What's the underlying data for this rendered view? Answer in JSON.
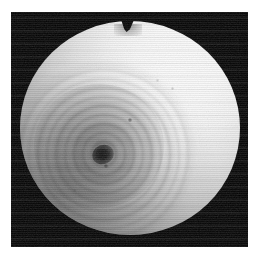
{
  "image": {
    "kind": "grayscale-photomicrograph",
    "subject_label": "spherical specimen with concentric spiral rings",
    "canvas_width": 258,
    "canvas_height": 258,
    "page_background": "#ffffff",
    "frame": {
      "label": "black image frame",
      "x": 11,
      "y": 12,
      "width": 237,
      "height": 235,
      "background_color": "#000000"
    },
    "specimen": {
      "label": "illuminated spherical body",
      "center_x": 130,
      "center_y": 128,
      "radius_x": 110,
      "radius_y": 107,
      "highlight_color": "#fdfdfd",
      "midtone_color": "#c9c9c9",
      "shadow_color": "#6a6a6a",
      "highlight_position": "upper-right",
      "shadow_position": "lower-left"
    },
    "notch": {
      "label": "V-shaped cleft at top apex",
      "center_x": 127,
      "top_y": 12,
      "depth": 18,
      "width": 24,
      "color": "#000000"
    },
    "spiral": {
      "label": "concentric ring / spiral structure",
      "center_x": 93,
      "center_y": 143,
      "outer_radius": 90,
      "ring_count": 14,
      "ring_spacing_px": 9,
      "ring_tone": "#141414",
      "core": {
        "label": "dark nucleus",
        "center_x": 92,
        "center_y": 144,
        "width": 22,
        "height": 19,
        "color": "#111111"
      }
    },
    "specks": [
      {
        "name": "speck-upper-right-1",
        "x": 157,
        "y": 80,
        "size": 3,
        "opacity": 0.16
      },
      {
        "name": "speck-upper-right-2",
        "x": 172,
        "y": 88,
        "size": 3,
        "opacity": 0.2
      },
      {
        "name": "speck-center-right",
        "x": 130,
        "y": 120,
        "size": 4,
        "opacity": 0.45
      },
      {
        "name": "speck-lower-center",
        "x": 106,
        "y": 166,
        "size": 4,
        "opacity": 0.42
      },
      {
        "name": "speck-upper-left",
        "x": 64,
        "y": 101,
        "size": 3,
        "opacity": 0.18
      },
      {
        "name": "speck-lower-left",
        "x": 74,
        "y": 190,
        "size": 3,
        "opacity": 0.15
      }
    ],
    "texture": {
      "label": "horizontal scanline interlace texture",
      "line_period_px": 2,
      "band_period_px": 13
    }
  }
}
